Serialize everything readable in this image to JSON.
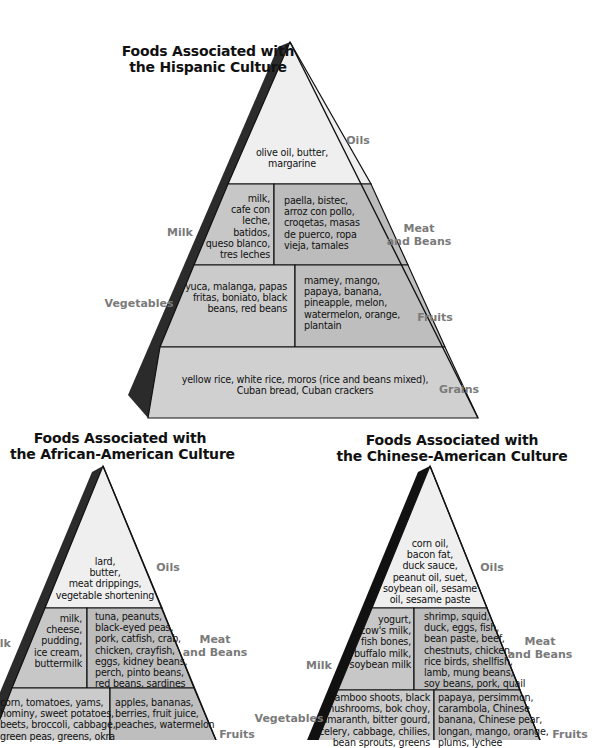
{
  "colors": {
    "oils_fill": "#efefef",
    "milk_fill": "#c7c7c7",
    "meat_fill": "#bdbdbd",
    "veg_fill": "#cbcbcb",
    "fruit_fill": "#bfbfbf",
    "grain_fill": "#d0d0d0",
    "side_shadow": "#2b2b2b",
    "outline": "#111111",
    "group_label": "#7a7a7a"
  },
  "pyramids": {
    "hispanic": {
      "title": [
        "Foods Associated with",
        "the Hispanic Culture"
      ],
      "oils": [
        "olive oil, butter,",
        "margarine"
      ],
      "milk": [
        "milk,",
        "cafe con",
        "leche,",
        "batidos,",
        "queso blanco,",
        "tres leches"
      ],
      "meat": [
        "paella, bistec,",
        "arroz con pollo,",
        "croqetas, masas",
        "de puerco, ropa",
        "vieja, tamales"
      ],
      "vegetables": [
        "yuca, malanga, papas",
        "fritas, boniato, black",
        "beans, red beans"
      ],
      "fruits": [
        "mamey, mango,",
        "papaya, banana,",
        "pineapple, melon,",
        "watermelon, orange,",
        "plantain"
      ],
      "grains": [
        "yellow rice, white rice, moros (rice and beans mixed),",
        "Cuban bread, Cuban crackers"
      ],
      "labels": {
        "oils": "Oils",
        "milk": "Milk",
        "meat": [
          "Meat",
          "and Beans"
        ],
        "vegetables": "Vegetables",
        "fruits": "Fruits",
        "grains": "Grains"
      }
    },
    "african_american": {
      "title": [
        "Foods Associated with",
        "the African-American Culture"
      ],
      "oils": [
        "lard,",
        "butter,",
        "meat drippings,",
        "vegetable shortening"
      ],
      "milk": [
        "milk,",
        "cheese,",
        "pudding,",
        "ice cream,",
        "buttermilk"
      ],
      "meat": [
        "tuna, peanuts,",
        "black-eyed peas,",
        "pork, catfish, crab,",
        "chicken, crayfish,",
        "eggs, kidney beans,",
        "perch, pinto beans,",
        "red beans, sardines"
      ],
      "vegetables": [
        "corn, tomatoes, yams,",
        "hominy, sweet potatoes,",
        "beets, broccoli, cabbage,",
        "green peas, greens, okra"
      ],
      "fruits": [
        "apples, bananas,",
        "berries, fruit juice,",
        "peaches, watermelon"
      ],
      "labels": {
        "oils": "Oils",
        "milk": "Milk",
        "meat": [
          "Meat",
          "and Beans"
        ],
        "fruits": "Fruits"
      }
    },
    "chinese_american": {
      "title": [
        "Foods Associated with",
        "the Chinese-American Culture"
      ],
      "oils": [
        "corn oil,",
        "bacon fat,",
        "duck sauce,",
        "peanut oil, suet,",
        "soybean oil, sesame",
        "oil, sesame paste"
      ],
      "milk": [
        "yogurt,",
        "cow's milk,",
        "fish bones,",
        "buffalo milk,",
        "soybean milk"
      ],
      "meat": [
        "shrimp, squid,",
        "duck, eggs, fish,",
        "bean paste, beef,",
        "chestnuts, chicken,",
        "rice birds, shellfish,",
        "lamb, mung beans,",
        "soy beans, pork, quail"
      ],
      "vegetables": [
        "bamboo shoots, black",
        "mushrooms, bok choy,",
        "amaranth, bitter gourd,",
        "celery, cabbage, chilies,",
        "bean sprouts, greens"
      ],
      "fruits": [
        "papaya, persimmon,",
        "carambola, Chinese",
        "banana, Chinese pear,",
        "longan, mango, orange,",
        "plums, lychee"
      ],
      "labels": {
        "oils": "Oils",
        "milk": "Milk",
        "meat": [
          "Meat",
          "and Beans"
        ],
        "vegetables": "Vegetables",
        "fruits": "Fruits"
      }
    }
  }
}
